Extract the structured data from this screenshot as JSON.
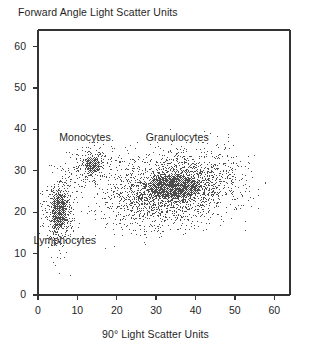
{
  "chart_data": {
    "type": "scatter",
    "title": "Forward Angle Light Scatter Units",
    "xlabel": "90° Light Scatter Units",
    "ylabel": "Forward Angle Light Scatter Units",
    "xlim": [
      0,
      64
    ],
    "ylim": [
      0,
      64
    ],
    "xticks": [
      0,
      10,
      20,
      30,
      40,
      50,
      60
    ],
    "yticks": [
      0,
      10,
      20,
      30,
      40,
      50,
      60
    ],
    "grid": false,
    "legend": "none",
    "dot_color": "#4d4d4d",
    "frame_color": "#333333",
    "annotations": [
      {
        "text": "Monocytes",
        "x": 13.0,
        "y": 38.0
      },
      {
        "text": "Granulocytes",
        "x": 35.0,
        "y": 38.0
      },
      {
        "text": "Lymphocytes",
        "x": 6.5,
        "y": 13.0
      }
    ],
    "series": [
      {
        "name": "Lymphocytes",
        "color": "#4d4d4d",
        "center": [
          5.2,
          20.5
        ],
        "spread": [
          1.5,
          3.6
        ],
        "n": 520,
        "core_x": [
          3.4,
          7.2
        ],
        "core_y": [
          15.5,
          25.0
        ]
      },
      {
        "name": "Monocytes",
        "color": "#4d4d4d",
        "center": [
          13.5,
          31.5
        ],
        "spread": [
          2.2,
          2.0
        ],
        "n": 230,
        "core_x": [
          11.5,
          16.0
        ],
        "core_y": [
          29.5,
          33.5
        ]
      },
      {
        "name": "Granulocytes",
        "color": "#4d4d4d",
        "center": [
          34.0,
          26.0
        ],
        "spread": [
          6.5,
          3.3
        ],
        "n": 2400,
        "core_x": [
          27.0,
          42.0
        ],
        "core_y": [
          23.0,
          29.5
        ]
      }
    ]
  },
  "chart": {
    "title": "Forward Angle Light Scatter Units",
    "xlabel": "90° Light Scatter Units",
    "yticks": [
      "60",
      "50",
      "40",
      "30",
      "20",
      "10",
      "0"
    ],
    "xticks": [
      "0",
      "10",
      "20",
      "30",
      "40",
      "50",
      "60"
    ],
    "labels": {
      "monocytes": "Monocytes",
      "granulocytes": "Granulocytes",
      "lymphocytes": "Lymphocytes"
    }
  }
}
